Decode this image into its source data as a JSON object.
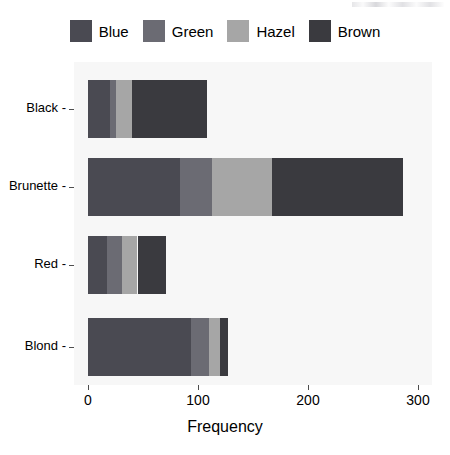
{
  "chart_data": {
    "type": "bar",
    "orientation": "horizontal",
    "stacked": true,
    "title": "",
    "xlabel": "Frequency",
    "ylabel": "",
    "xlim": [
      0,
      300
    ],
    "xticks": [
      0,
      100,
      200,
      300
    ],
    "xtick_labels": [
      "0",
      "100",
      "200",
      "300"
    ],
    "grid": false,
    "legend_position": "top",
    "categories": [
      "Black",
      "Brunette",
      "Red",
      "Blond"
    ],
    "series": [
      {
        "name": "Blue",
        "color": "#4a4a52",
        "values": [
          20,
          84,
          17,
          94
        ]
      },
      {
        "name": "Green",
        "color": "#6b6b73",
        "values": [
          5,
          29,
          14,
          16
        ]
      },
      {
        "name": "Hazel",
        "color": "#a6a6a6",
        "values": [
          15,
          54,
          14,
          10
        ]
      },
      {
        "name": "Brown",
        "color": "#3a3a3f",
        "values": [
          68,
          119,
          26,
          7
        ]
      }
    ],
    "totals": [
      108,
      286,
      71,
      127
    ],
    "panel_background": "#f7f7f7",
    "page_background": "#ffffff",
    "axis_color": "#4d4d4d",
    "text_color": "#000000"
  },
  "legend": {
    "items": [
      {
        "label": "Blue"
      },
      {
        "label": "Green"
      },
      {
        "label": "Hazel"
      },
      {
        "label": "Brown"
      }
    ]
  },
  "axes": {
    "x_title": "Frequency",
    "x_tick_labels": [
      "0",
      "100",
      "200",
      "300"
    ],
    "y_tick_labels": [
      "Black",
      "Brunette",
      "Red",
      "Blond"
    ],
    "y_tick_dash": "-"
  }
}
